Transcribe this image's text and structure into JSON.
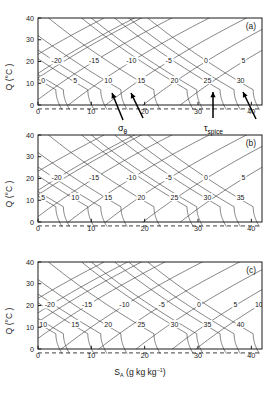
{
  "figure": {
    "xlabel_main": "S",
    "xlabel_sub": "A",
    "xlabel_units": "(g kg",
    "xlabel_units_exp": "−1",
    "xlabel_units_close": ")",
    "ylabel": "Q (°C )",
    "annotation_sigma": "σ",
    "annotation_sigma_sub": "θ",
    "annotation_tau": "τ",
    "annotation_tau_sub": "spice"
  },
  "chart_data": {
    "type": "line",
    "title": "",
    "xlabel": "S_A (g kg^-1)",
    "ylabel": "Θ (°C)",
    "xlim": [
      0,
      42
    ],
    "ylim": [
      -3,
      40
    ],
    "xticks": [
      0,
      10,
      20,
      30,
      40
    ],
    "yticks": [
      0,
      10,
      20,
      30,
      40
    ],
    "grid": false,
    "legend": "none",
    "freezing_line_value": -1.8,
    "panels": [
      {
        "label": "(a)",
        "density_contour_labels": [
          -20,
          -15,
          -10,
          -5,
          0,
          5
        ],
        "density_label_y": 20,
        "density_label_x": [
          3.5,
          10.5,
          17.5,
          24.5,
          31.5,
          38.5
        ],
        "spice_contour_labels": [
          0,
          5,
          10,
          15,
          20,
          25,
          30
        ],
        "spice_label_y": 11,
        "spice_label_x": [
          0.6,
          6.6,
          12.8,
          19.0,
          25.2,
          31.4,
          37.6
        ],
        "density_slope_sign": "positive",
        "spice_slope_sign": "negative"
      },
      {
        "label": "(b)",
        "density_contour_labels": [
          -20,
          -15,
          -10,
          -5,
          0,
          5
        ],
        "density_label_y": 20,
        "density_label_x": [
          3.5,
          10.5,
          17.5,
          24.5,
          31.5,
          38.5
        ],
        "spice_contour_labels": [
          5,
          10,
          15,
          20,
          25,
          30,
          35
        ],
        "spice_label_y": 11,
        "spice_label_x": [
          0.6,
          6.6,
          12.8,
          19.0,
          25.2,
          31.4,
          37.6
        ],
        "density_slope_sign": "positive",
        "spice_slope_sign": "negative"
      },
      {
        "label": "(c)",
        "density_contour_labels": [
          -20,
          -15,
          -10,
          -5,
          0,
          5,
          10
        ],
        "density_label_y": 20,
        "density_label_x": [
          2.2,
          9.2,
          16.2,
          23.2,
          30.2,
          37.0,
          41.4
        ],
        "spice_contour_labels": [
          10,
          15,
          20,
          25,
          30,
          35,
          40
        ],
        "spice_label_y": 11,
        "spice_label_x": [
          0.6,
          6.6,
          12.8,
          19.0,
          25.2,
          31.4,
          37.6
        ],
        "density_slope_sign": "positive",
        "spice_slope_sign": "negative"
      }
    ]
  }
}
